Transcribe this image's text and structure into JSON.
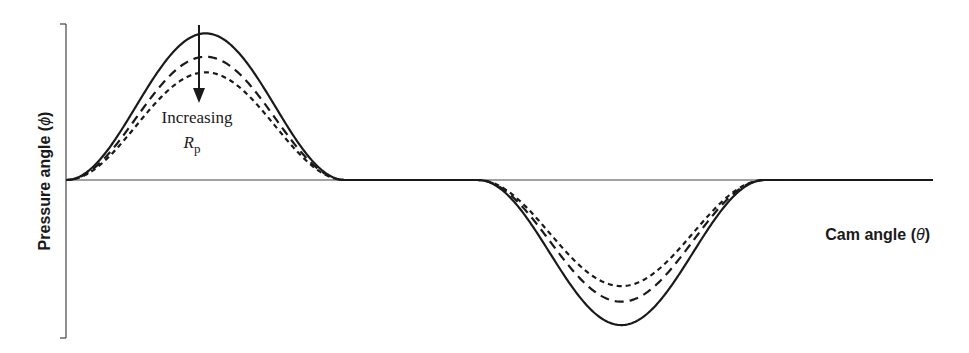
{
  "chart_data": {
    "type": "line",
    "title": "",
    "xlabel": "Cam angle",
    "xlabel_symbol": "θ",
    "ylabel": "Pressure angle",
    "ylabel_symbol": "ϕ",
    "xlim": [
      0,
      1
    ],
    "ylim": [
      -1,
      1
    ],
    "grid": false,
    "legend": "none",
    "x_units": "normalized fraction of cam rotation (unlabeled)",
    "y_units": "normalized pressure angle (unlabeled)",
    "segments": [
      {
        "name": "rise",
        "start": 0.0,
        "end": 0.322,
        "sign": 1
      },
      {
        "name": "dwell",
        "start": 0.322,
        "end": 0.475,
        "sign": 0
      },
      {
        "name": "return",
        "start": 0.475,
        "end": 0.806,
        "sign": -1
      },
      {
        "name": "dwell",
        "start": 0.806,
        "end": 1.0,
        "sign": 0
      }
    ],
    "series": [
      {
        "name": "smallest Rp",
        "style": "solid",
        "peak": 0.94,
        "trough": -0.93
      },
      {
        "name": "medium Rp",
        "style": "dashed",
        "peak": 0.79,
        "trough": -0.78
      },
      {
        "name": "largest Rp",
        "style": "dotted",
        "peak": 0.69,
        "trough": -0.68
      }
    ],
    "annotations": [
      {
        "text": "Increasing",
        "symbol": "R",
        "subscript": "p",
        "arrow": "down",
        "x": 0.155
      }
    ],
    "colors": {
      "line": "#1a1a1a",
      "axis": "#444444"
    }
  }
}
